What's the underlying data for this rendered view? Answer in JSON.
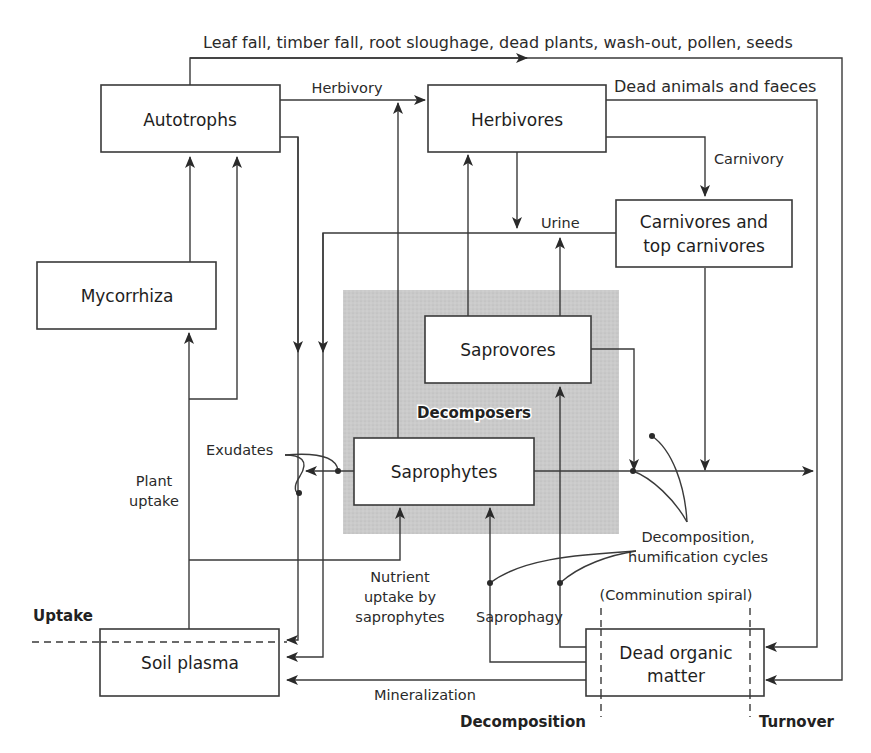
{
  "diagram": {
    "shaded_region": {
      "label": "Decomposers",
      "color": "#c8c8c8"
    },
    "nodes": {
      "autotrophs": "Autotrophs",
      "herbivores": "Herbivores",
      "carnivores_line1": "Carnivores and",
      "carnivores_line2": "top carnivores",
      "mycorrhiza": "Mycorrhiza",
      "saprovores": "Saprovores",
      "saprophytes": "Saprophytes",
      "soil_plasma": "Soil plasma",
      "dead_organic_line1": "Dead organic",
      "dead_organic_line2": "matter"
    },
    "flow_labels": {
      "leaf_fall": "Leaf fall, timber fall, root sloughage, dead plants, wash-out, pollen, seeds",
      "herbivory": "Herbivory",
      "dead_animals": "Dead animals and faeces",
      "carnivory": "Carnivory",
      "urine": "Urine",
      "exudates": "Exudates",
      "plant_uptake_line1": "Plant",
      "plant_uptake_line2": "uptake",
      "nutrient_uptake_line1": "Nutrient",
      "nutrient_uptake_line2": "uptake by",
      "nutrient_uptake_line3": "saprophytes",
      "saprophagy": "Saprophagy",
      "decomp_cycles_line1": "Decomposition,",
      "decomp_cycles_line2": "humification cycles",
      "comminution": "(Comminution spiral)",
      "mineralization": "Mineralization"
    },
    "zone_labels": {
      "uptake": "Uptake",
      "decomposition": "Decomposition",
      "turnover": "Turnover"
    }
  }
}
